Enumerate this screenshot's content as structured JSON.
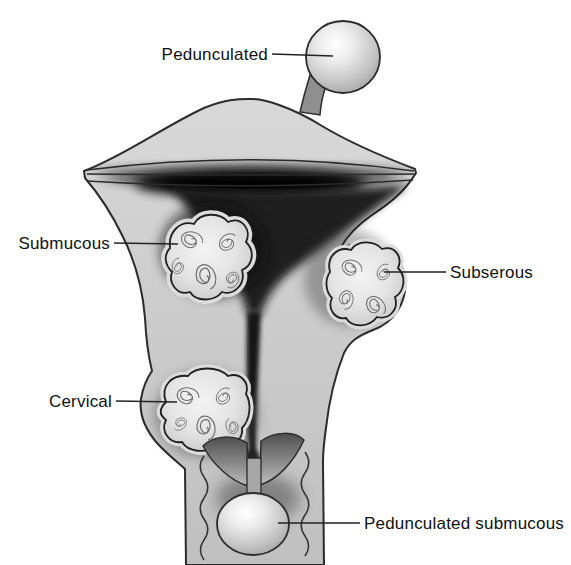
{
  "figure": {
    "type": "medical-diagram",
    "background": "#ffffff",
    "labels": {
      "pedunculated": "Pedunculated",
      "submucous": "Submucous",
      "subserous": "Subserous",
      "cervical": "Cervical",
      "pedunculated_submucous": "Pedunculated submucous"
    },
    "colors": {
      "outline": "#2b2b2b",
      "tissue": "#cbcbcb",
      "cavity": "#101010",
      "fibroid_fill": "#e6e6e6",
      "fibroid_swirl": "#6f6f6f",
      "stalk": "#8f8f8f",
      "leader_line": "#222222",
      "label_text": "#111111"
    }
  }
}
